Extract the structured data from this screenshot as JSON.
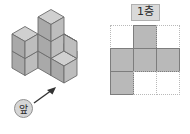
{
  "figure": {
    "title_hidden": "",
    "floor_label": "1층",
    "left": {
      "name": "isometric-cube-stack",
      "front_label": "앞",
      "arrow_direction": "up-right",
      "cube_count": 8,
      "face_colors": {
        "top": "#d0d0d0",
        "left": "#a9a9a9",
        "right": "#bdbdbd",
        "edge": "#6b6b6b"
      }
    },
    "right": {
      "name": "first-floor-base-plan",
      "front_label": "앞",
      "arrow_direction": "up",
      "grid_rows": 3,
      "grid_cols": 3,
      "filled_color": "#b9b9b9",
      "grid_line_color": "#b9b9b9",
      "cells": [
        [
          0,
          1,
          0
        ],
        [
          1,
          1,
          1
        ],
        [
          1,
          0,
          0
        ]
      ],
      "cell_labels": [
        [
          "",
          "",
          ""
        ],
        [
          "",
          "",
          ""
        ],
        [
          "",
          "",
          ""
        ]
      ]
    }
  }
}
